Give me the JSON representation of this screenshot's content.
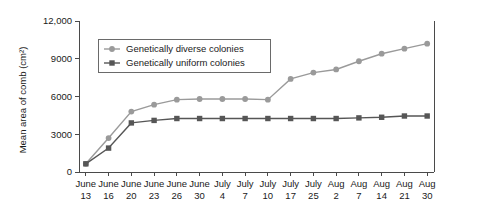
{
  "chart_data": {
    "type": "line",
    "title": "",
    "xlabel": "",
    "ylabel": "Mean area of comb (cm²)",
    "ylim": [
      0,
      12000
    ],
    "yticks": [
      0,
      3000,
      6000,
      9000,
      12000
    ],
    "ytick_labels": [
      "0",
      "3000",
      "6000",
      "9000",
      "12,000"
    ],
    "grid": false,
    "legend_position": "upper left inside",
    "categories": [
      "June 13",
      "June 16",
      "June 20",
      "June 23",
      "June 26",
      "June 30",
      "July 4",
      "July 7",
      "July 10",
      "July 17",
      "July 25",
      "Aug 2",
      "Aug 7",
      "Aug 14",
      "Aug 21",
      "Aug 30"
    ],
    "xtick_month_labels": [
      "June",
      "June",
      "June",
      "June",
      "June",
      "June",
      "July",
      "July",
      "July",
      "July",
      "July",
      "Aug",
      "Aug",
      "Aug",
      "Aug",
      "Aug"
    ],
    "xtick_day_labels": [
      "13",
      "16",
      "20",
      "23",
      "26",
      "30",
      "4",
      "7",
      "10",
      "17",
      "25",
      "2",
      "7",
      "14",
      "21",
      "30"
    ],
    "series": [
      {
        "name": "Genetically diverse colonies",
        "color": "#9a9a9a",
        "marker": "circle",
        "values": [
          650,
          2700,
          4800,
          5350,
          5750,
          5800,
          5800,
          5800,
          5750,
          7400,
          7900,
          8150,
          8800,
          9400,
          9800,
          10200
        ]
      },
      {
        "name": "Genetically uniform colonies",
        "color": "#565656",
        "marker": "square",
        "values": [
          650,
          1900,
          3900,
          4100,
          4250,
          4250,
          4250,
          4250,
          4250,
          4250,
          4250,
          4250,
          4300,
          4350,
          4450,
          4450
        ]
      }
    ]
  },
  "legend": {
    "items": [
      {
        "label": "Genetically diverse colonies"
      },
      {
        "label": "Genetically uniform colonies"
      }
    ]
  }
}
